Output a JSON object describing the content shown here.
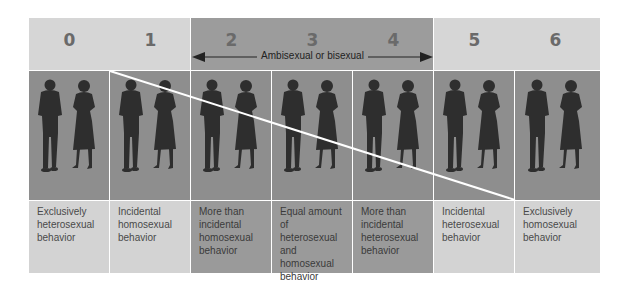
{
  "colors": {
    "header_light": "#d6d6d6",
    "header_dark": "#9c9c9c",
    "photo_bg": "#8e8e8e",
    "silhouette": "#2e2e2e",
    "desc_light": "#d3d3d3",
    "desc_dark": "#9a9a9a",
    "number_text": "#6a6a6a",
    "divider": "#ffffff"
  },
  "ambisexual_label": "Ambisexual or bisexual",
  "scale": [
    {
      "rating": "0",
      "description": "Exclusively heterosexual behavior",
      "shade": "light"
    },
    {
      "rating": "1",
      "description": "Incidental homosexual behavior",
      "shade": "light"
    },
    {
      "rating": "2",
      "description": "More than incidental homosexual behavior",
      "shade": "dark"
    },
    {
      "rating": "3",
      "description": "Equal amount of heterosexual and homosexual behavior",
      "shade": "dark"
    },
    {
      "rating": "4",
      "description": "More than incidental heterosexual behavior",
      "shade": "dark"
    },
    {
      "rating": "5",
      "description": "Incidental heterosexual behavior",
      "shade": "light"
    },
    {
      "rating": "6",
      "description": "Exclusively homosexual behavior",
      "shade": "light"
    }
  ],
  "icons": {
    "figure": "man-and-woman-silhouette",
    "arrow_left": "arrow-left-icon",
    "arrow_right": "arrow-right-icon"
  }
}
